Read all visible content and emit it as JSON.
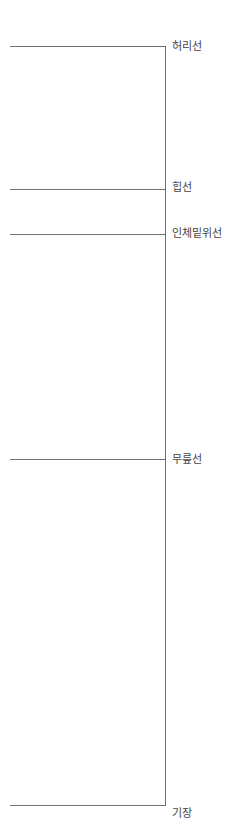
{
  "diagram": {
    "type": "pattern-reference-lines",
    "vertical_line": {
      "x": 165,
      "top": 46,
      "bottom": 805
    },
    "lines": [
      {
        "label": "허리선",
        "y": 46,
        "x_start": 10,
        "label_y": 40
      },
      {
        "label": "힙선",
        "y": 189,
        "x_start": 10,
        "label_y": 181
      },
      {
        "label": "인체밑위선",
        "y": 234,
        "x_start": 10,
        "label_y": 227
      },
      {
        "label": "무릎선",
        "y": 459,
        "x_start": 10,
        "label_y": 453
      },
      {
        "label": "기장",
        "y": 805,
        "x_start": 10,
        "label_y": 803
      }
    ],
    "line_color": "#707070",
    "text_color": "#444444"
  }
}
